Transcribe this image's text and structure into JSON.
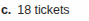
{
  "document": {
    "type": "answer-key-fragment",
    "background_color": "#fefefe",
    "text_color": "#2b2b2b",
    "label_color": "#262626"
  },
  "answer": {
    "item_label": "c.",
    "value": "18",
    "unit": "tickets",
    "full_text": "18 tickets"
  }
}
